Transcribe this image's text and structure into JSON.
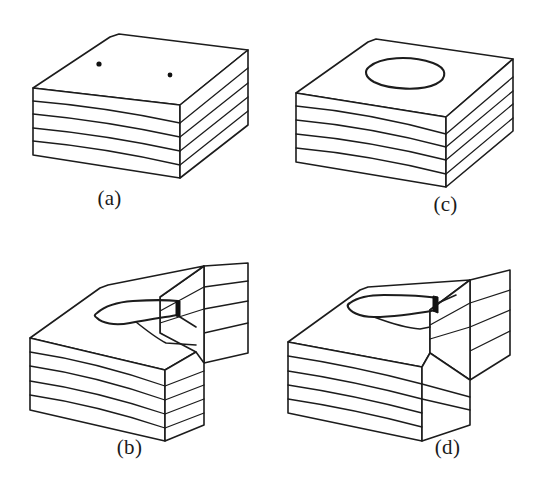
{
  "figure": {
    "background_color": "#ffffff",
    "line_color": "#1c1c1c",
    "width": 541,
    "height": 490
  },
  "panels": [
    {
      "id": "a",
      "label": "(a)",
      "description": "Layered rectangular block with four visible strata and two small dots on the top face",
      "layer_count": 4,
      "top_face_features": [
        "dot",
        "dot"
      ]
    },
    {
      "id": "c",
      "label": "(c)",
      "description": "Layered rectangular block with four visible strata and an elongated elliptical outline on the top face",
      "layer_count": 4,
      "top_face_features": [
        "ellipse"
      ]
    },
    {
      "id": "b",
      "label": "(b)",
      "description": "Layered block with a stepped cut at the right rear and a tongue-shaped outline on the top face",
      "layer_count": 4,
      "top_face_features": [
        "tongue",
        "step-cut"
      ]
    },
    {
      "id": "d",
      "label": "(d)",
      "description": "Layered block with a stepped right side and a narrow tapering tongue outline on the top face",
      "layer_count": 4,
      "top_face_features": [
        "tongue",
        "step"
      ]
    }
  ]
}
